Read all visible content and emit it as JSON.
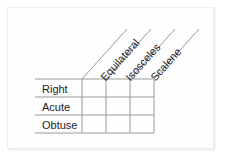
{
  "diagram": {
    "type": "classification-grid",
    "columns": [
      {
        "label": "Equilateral"
      },
      {
        "label": "Isosceles"
      },
      {
        "label": "Scalene"
      }
    ],
    "rows": [
      {
        "label": "Right"
      },
      {
        "label": "Acute"
      },
      {
        "label": "Obtuse"
      }
    ],
    "cells": [
      [
        "",
        "",
        ""
      ],
      [
        "",
        "",
        ""
      ],
      [
        "",
        "",
        ""
      ]
    ],
    "line_color": "#9a9a9a",
    "text_color": "#222222"
  }
}
